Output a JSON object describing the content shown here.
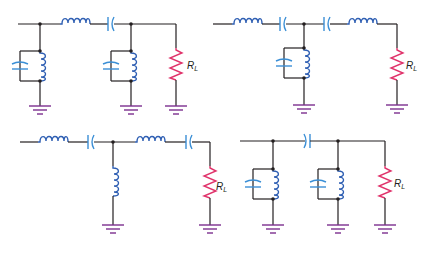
{
  "figure": {
    "colors": {
      "wire": "#231f20",
      "inductor": "#2f5fb3",
      "capacitor": "#3b8fd6",
      "resistor": "#e0336b",
      "ground": "#7b2f8e"
    },
    "circuits": [
      {
        "id": "top-left",
        "series_elements": [
          "inductor",
          "capacitor"
        ],
        "shunt_elements": [
          "parallel-LC-tank",
          "parallel-LC-tank"
        ],
        "load_label": "R",
        "load_subscript": "L"
      },
      {
        "id": "top-right",
        "series_elements": [
          "inductor",
          "capacitor",
          "capacitor",
          "inductor"
        ],
        "shunt_elements": [
          "parallel-LC-tank"
        ],
        "load_label": "R",
        "load_subscript": "L"
      },
      {
        "id": "bottom-left",
        "series_elements": [
          "inductor",
          "capacitor",
          "inductor",
          "capacitor"
        ],
        "shunt_elements": [
          "inductor"
        ],
        "load_label": "R",
        "load_subscript": "L"
      },
      {
        "id": "bottom-right",
        "series_elements": [
          "capacitor"
        ],
        "shunt_elements": [
          "parallel-LC-tank",
          "parallel-LC-tank"
        ],
        "load_label": "R",
        "load_subscript": "L"
      }
    ]
  }
}
